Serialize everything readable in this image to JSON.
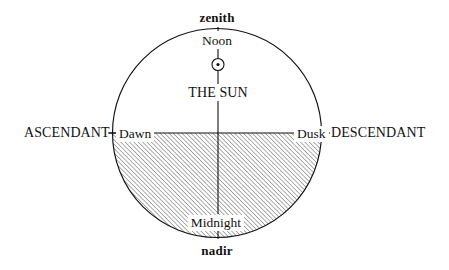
{
  "diagram": {
    "type": "astrological-day-circle",
    "colors": {
      "stroke": "#111111",
      "background": "#ffffff",
      "hatch": "#4a4a4a"
    },
    "circle": {
      "center_x": 217,
      "center_y": 133,
      "radius": 105
    },
    "shading": {
      "region": "lower-semicircle",
      "style": "diagonal-hatch",
      "angle_degrees": 45,
      "meaning": "night / below the horizon"
    },
    "labels": {
      "zenith": "zenith",
      "nadir": "nadir",
      "noon": "Noon",
      "midnight": "Midnight",
      "the_sun": "THE SUN",
      "dawn": "Dawn",
      "dusk": "Dusk",
      "ascendant": "ASCENDANT",
      "descendant": "DESCENDANT"
    },
    "glyphs": {
      "sun_symbol": "sun-symbol",
      "sun_symbol_unicode": "☉"
    },
    "axes": {
      "vertical": {
        "name": "meridian-axis",
        "top_label": "Noon",
        "bottom_label": "Midnight"
      },
      "horizontal": {
        "name": "horizon-axis",
        "left_label": "Dawn",
        "right_label": "Dusk"
      }
    }
  }
}
